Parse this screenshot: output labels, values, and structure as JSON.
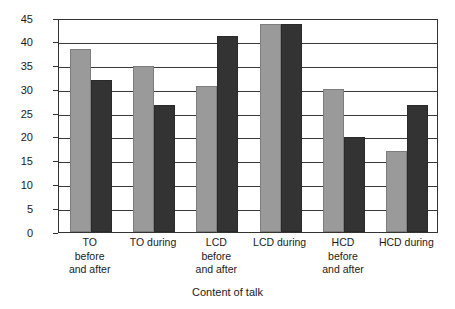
{
  "chart_data": {
    "type": "bar",
    "title": "",
    "xlabel": "Content of talk",
    "ylabel": "Percentage of total teacher talk",
    "categories": [
      "TO\nbefore\nand after",
      "TO during",
      "LCD\nbefore\nand after",
      "LCD during",
      "HCD\nbefore\nand after",
      "HCD during"
    ],
    "series": [
      {
        "name": "series-1-light-gray",
        "color": "#9a9a9a",
        "values": [
          38.5,
          35.0,
          30.8,
          43.8,
          30.0,
          17.0
        ]
      },
      {
        "name": "series-2-dark-gray",
        "color": "#333333",
        "values": [
          32.0,
          26.8,
          41.3,
          43.8,
          20.0,
          26.8
        ]
      }
    ],
    "ylim": [
      0,
      45
    ],
    "ytick_labels": [
      "0",
      "5",
      "10",
      "15",
      "20",
      "25",
      "30",
      "35",
      "40",
      "45"
    ],
    "ytick_values": [
      0,
      5,
      10,
      15,
      20,
      25,
      30,
      35,
      40,
      45
    ],
    "grid": "horizontal",
    "legend": "none",
    "frame": "box",
    "colors": {
      "axis": "#333333",
      "gridline": "#3a3a3a",
      "background": "#ffffff",
      "light_bar": "#9a9a9a",
      "dark_bar": "#333333"
    }
  }
}
